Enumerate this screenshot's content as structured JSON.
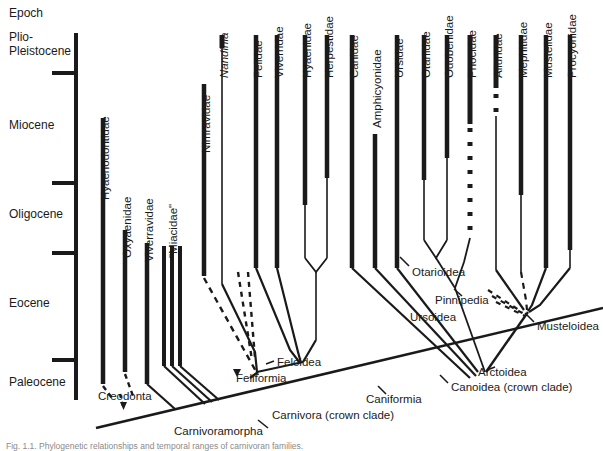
{
  "figure": {
    "axis_title": "Epoch",
    "epochs": [
      {
        "name": "Plio-\nPleistocene",
        "label_top": 30
      },
      {
        "name": "Miocene",
        "label_top": 118
      },
      {
        "name": "Oligocene",
        "label_top": 207
      },
      {
        "name": "Eocene",
        "label_top": 296
      },
      {
        "name": "Paleocene",
        "label_top": 375
      }
    ],
    "taxa": [
      {
        "name": "Hyaenodontidae",
        "x": 103,
        "label_y": 200
      },
      {
        "name": "Oxyaenidae",
        "x": 125,
        "label_y": 258
      },
      {
        "name": "Viverravidae",
        "x": 147,
        "label_y": 262
      },
      {
        "name": "\"Miacidae\"",
        "x": 170,
        "label_y": 258
      },
      {
        "name": "Nimravidae",
        "x": 204,
        "label_y": 153
      },
      {
        "name": "Nandinia",
        "x": 222,
        "label_y": 78,
        "italic": true
      },
      {
        "name": "Felidae",
        "x": 256,
        "label_y": 78
      },
      {
        "name": "Viverridae",
        "x": 277,
        "label_y": 78
      },
      {
        "name": "Hyaenidae",
        "x": 305,
        "label_y": 78
      },
      {
        "name": "Herpestidae",
        "x": 327,
        "label_y": 78
      },
      {
        "name": "Canidae",
        "x": 352,
        "label_y": 78
      },
      {
        "name": "Amphicyonidae",
        "x": 375,
        "label_y": 128
      },
      {
        "name": "Ursidae",
        "x": 397,
        "label_y": 78
      },
      {
        "name": "Otariidae",
        "x": 424,
        "label_y": 78
      },
      {
        "name": "Odobenidae",
        "x": 447,
        "label_y": 78
      },
      {
        "name": "Phocidae",
        "x": 470,
        "label_y": 78
      },
      {
        "name": "Ailuridae",
        "x": 496,
        "label_y": 78
      },
      {
        "name": "Mephitidae",
        "x": 521,
        "label_y": 78
      },
      {
        "name": "Mustelidae",
        "x": 546,
        "label_y": 78
      },
      {
        "name": "Procyonidae",
        "x": 570,
        "label_y": 78
      }
    ],
    "clades": [
      {
        "name": "Creodonta",
        "x": 98,
        "y": 390
      },
      {
        "name": "Feloidea",
        "x": 248,
        "y": 362
      },
      {
        "name": "Feliformia",
        "x": 236,
        "y": 379
      },
      {
        "name": "Carnivoramorpha",
        "x": 196,
        "y": 425
      },
      {
        "name": "Carnivora (crown clade)",
        "x": 272,
        "y": 410
      },
      {
        "name": "Caniformia",
        "x": 366,
        "y": 396
      },
      {
        "name": "Otarioidea",
        "x": 415,
        "y": 270
      },
      {
        "name": "Pinnipedia",
        "x": 438,
        "y": 298
      },
      {
        "name": "Ursoidea",
        "x": 415,
        "y": 315
      },
      {
        "name": "Musteloidea",
        "x": 537,
        "y": 325
      },
      {
        "name": "Arctoidea",
        "x": 478,
        "y": 370
      },
      {
        "name": "Canoidea (crown clade)",
        "x": 454,
        "y": 384
      }
    ],
    "caption": "Fig. 1.1. Phylogenetic relationships and temporal ranges of carnivoran families."
  },
  "colors": {
    "ink": "#1a1a1a",
    "background": "#ffffff",
    "caption": "#8a8a8a"
  }
}
